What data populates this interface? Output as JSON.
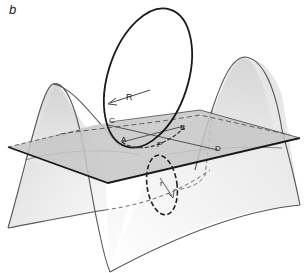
{
  "figure": {
    "panel_label": "b",
    "labels": {
      "R": "R",
      "r": "r",
      "A": "A",
      "B": "B",
      "C": "C",
      "D": "D",
      "P": "P"
    }
  },
  "colors": {
    "line": "#555555",
    "dark_line": "#1a1a1a",
    "surface_fill": "#e4e4e4",
    "plane_fill": "#c9c9c9",
    "background": "#ffffff"
  }
}
